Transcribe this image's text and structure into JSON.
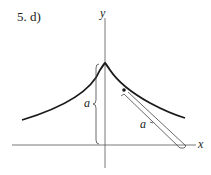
{
  "problem_label": "5. d)",
  "axes": {
    "x_label": "x",
    "y_label": "y"
  },
  "annotations": {
    "vertical_length": "a",
    "tangent_length": "a"
  },
  "curve": {
    "name": "tractrix",
    "color": "#1a1a1a"
  }
}
